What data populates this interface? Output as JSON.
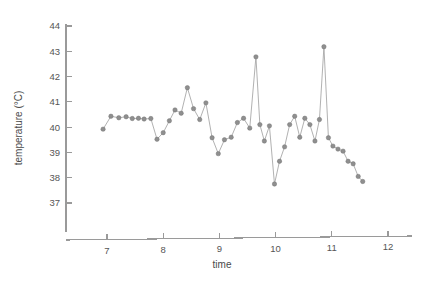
{
  "chart_data": {
    "type": "line",
    "title": "",
    "subtitle": "",
    "xlabel": "time",
    "ylabel": "temperature (°C)",
    "xlim": [
      6.55,
      12.45
    ],
    "ylim": [
      36.55,
      44.3
    ],
    "xticks": [
      7,
      8,
      9,
      10,
      11,
      12
    ],
    "xticklabels": [
      "7",
      "8",
      "9",
      "10",
      "11",
      "12"
    ],
    "yticks": [
      37,
      38,
      39,
      40,
      41,
      42,
      43,
      44
    ],
    "yticklabels": [
      "37",
      "38",
      "39",
      "40",
      "41",
      "42",
      "43",
      "44"
    ],
    "grid": false,
    "legend": null,
    "marker": "circle",
    "marker_color": "#8f8f8f",
    "line_color": "#a8a8a8",
    "axis_color": "#9a9a9a",
    "series": [
      {
        "name": "temperature",
        "x": [
          6.93,
          7.07,
          7.21,
          7.34,
          7.45,
          7.56,
          7.66,
          7.78,
          7.89,
          8.0,
          8.11,
          8.21,
          8.32,
          8.43,
          8.54,
          8.65,
          8.76,
          8.87,
          8.98,
          9.09,
          9.21,
          9.32,
          9.43,
          9.54,
          9.65,
          9.72,
          9.8,
          9.89,
          9.98,
          10.07,
          10.16,
          10.25,
          10.34,
          10.43,
          10.52,
          10.61,
          10.7,
          10.78,
          10.86,
          10.94,
          11.02,
          11.11,
          11.2,
          11.29,
          11.38,
          11.47,
          11.55
        ],
        "y": [
          39.92,
          40.43,
          40.37,
          40.41,
          40.34,
          40.35,
          40.32,
          40.34,
          39.52,
          39.78,
          40.25,
          40.68,
          40.55,
          41.56,
          40.73,
          40.3,
          40.96,
          39.58,
          38.95,
          39.5,
          39.6,
          40.18,
          40.35,
          39.96,
          42.78,
          40.1,
          39.45,
          40.05,
          37.75,
          38.65,
          39.22,
          40.1,
          40.43,
          39.6,
          40.35,
          40.1,
          39.45,
          40.3,
          43.18,
          39.58,
          39.25,
          39.13,
          39.05,
          38.65,
          38.55,
          38.05,
          37.85
        ]
      }
    ]
  },
  "axes": {
    "x_title": "time",
    "y_title": "temperature (°C)"
  }
}
